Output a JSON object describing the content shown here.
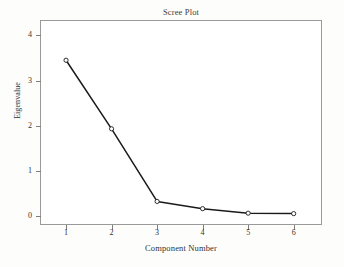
{
  "chart_data": {
    "type": "line",
    "title": "Scree Plot",
    "xlabel": "Component Number",
    "ylabel": "Eigenvalue",
    "x": [
      1,
      2,
      3,
      4,
      5,
      6
    ],
    "values": [
      3.45,
      1.93,
      0.32,
      0.16,
      0.06,
      0.05
    ],
    "categories": [
      "1",
      "2",
      "3",
      "4",
      "5",
      "6"
    ],
    "xtick_labels": [
      "1",
      "2",
      "3",
      "4",
      "5",
      "6"
    ],
    "ytick_labels": [
      "0",
      "1",
      "2",
      "3",
      "4"
    ],
    "ytick_values": [
      0,
      1,
      2,
      3,
      4
    ],
    "xlim": [
      0.45,
      6.6
    ],
    "ylim": [
      -0.18,
      4.32
    ],
    "grid": false,
    "legend": null,
    "marker": "open-circle",
    "line_color": "#1a1a1a",
    "marker_edge_color": "#1a1a1a",
    "marker_face_color": "#ffffff",
    "frame_color": "#9a9a9a",
    "plot_background": "#ffffff",
    "series": [
      {
        "name": "Eigenvalue",
        "points": [
          {
            "x": 1,
            "y": 3.45
          },
          {
            "x": 2,
            "y": 1.93
          },
          {
            "x": 3,
            "y": 0.32
          },
          {
            "x": 4,
            "y": 0.16
          },
          {
            "x": 5,
            "y": 0.06
          },
          {
            "x": 6,
            "y": 0.05
          }
        ]
      }
    ]
  }
}
